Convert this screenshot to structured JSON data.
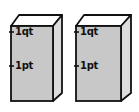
{
  "diagram": {
    "colors": {
      "front_face": "#c8c8c8",
      "side_face": "#dcdcdc",
      "top_face": "#ffffff",
      "outline": "#111111"
    },
    "cartons": [
      {
        "marks": [
          {
            "label": "1qt"
          },
          {
            "label": "1pt"
          }
        ]
      },
      {
        "marks": [
          {
            "label": "1qt"
          },
          {
            "label": "1pt"
          }
        ]
      }
    ]
  }
}
